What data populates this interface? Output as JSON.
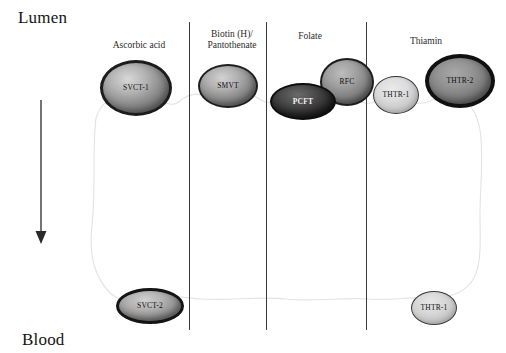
{
  "figure": {
    "top_compartment_label": "Lumen",
    "bottom_compartment_label": "Blood"
  },
  "columns": [
    {
      "id": "ascorbic-acid",
      "label": "Ascorbic acid",
      "left": 96,
      "top": 40,
      "width": 86
    },
    {
      "id": "biotin-pantothenate",
      "label": "Biotin (H)/\nPantothenate",
      "left": 192,
      "top": 29,
      "width": 80
    },
    {
      "id": "folate",
      "label": "Folate",
      "left": 272,
      "top": 31,
      "width": 76
    },
    {
      "id": "thiamin",
      "label": "Thiamin",
      "left": 386,
      "top": 36,
      "width": 80
    }
  ],
  "dividers": [
    {
      "id": "divider-1",
      "x": 189,
      "top": 22,
      "height": 308
    },
    {
      "id": "divider-2",
      "x": 266,
      "top": 22,
      "height": 308
    },
    {
      "id": "divider-3",
      "x": 366,
      "top": 22,
      "height": 308
    }
  ],
  "transporters": {
    "apical": [
      {
        "id": "svct1",
        "label": "SVCT-1",
        "column": "ascorbic-acid"
      },
      {
        "id": "smvt",
        "label": "SMVT",
        "column": "biotin-pantothenate"
      },
      {
        "id": "pcft",
        "label": "PCFT",
        "column": "folate"
      },
      {
        "id": "rfc",
        "label": "RFC",
        "column": "folate"
      },
      {
        "id": "thtr1-top",
        "label": "THTR-1",
        "column": "thiamin"
      },
      {
        "id": "thtr2",
        "label": "THTR-2",
        "column": "thiamin"
      }
    ],
    "basolateral": [
      {
        "id": "svct2",
        "label": "SVCT-2",
        "column": "ascorbic-acid"
      },
      {
        "id": "thtr1-bot",
        "label": "THTR-1",
        "column": "thiamin"
      }
    ]
  },
  "direction_arrow": {
    "name": "downward-transport-arrow",
    "from_label": "Lumen",
    "to_label": "Blood",
    "x": 41,
    "y_start": 100,
    "y_end": 242
  },
  "colors": {
    "background": "#ffffff",
    "text": "#1a1a1a",
    "divider": "#3a3a3a",
    "membrane_outline": "#e2e2e2",
    "arrow": "#2a2a2a"
  }
}
